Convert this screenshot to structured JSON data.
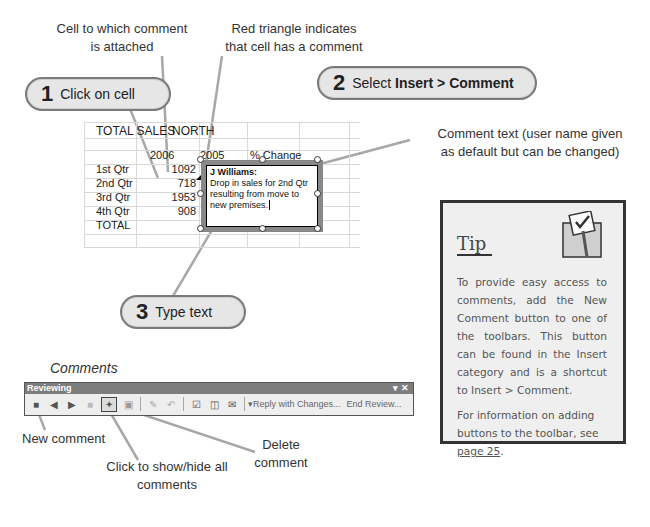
{
  "callouts": {
    "cell_attached": [
      "Cell to which comment",
      "is attached"
    ],
    "red_triangle": [
      "Red triangle indicates",
      "that cell has a comment"
    ],
    "comment_text": [
      "Comment text (user name given",
      "as default but can be changed)"
    ],
    "new_comment": "New comment",
    "show_hide": [
      "Click to show/hide all",
      "comments"
    ],
    "delete_comment": [
      "Delete",
      "comment"
    ]
  },
  "steps": [
    {
      "num": "1",
      "label": "Click on cell"
    },
    {
      "num": "2",
      "label_prefix": "Select ",
      "label_bold": "Insert > Comment"
    },
    {
      "num": "3",
      "label": "Type text"
    }
  ],
  "sheet": {
    "title": "TOTAL SALES",
    "region": "NORTH",
    "headers": [
      "2006",
      "2005",
      "% Change"
    ],
    "rows": [
      {
        "label": "1st Qtr",
        "value": "1092"
      },
      {
        "label": "2nd Qtr",
        "value": "718"
      },
      {
        "label": "3rd Qtr",
        "value": "1953"
      },
      {
        "label": "4th Qtr",
        "value": "908"
      },
      {
        "label": "TOTAL",
        "value": ""
      }
    ],
    "comment": {
      "author": "J Williams:",
      "lines": [
        "Drop in sales for 2nd Qtr",
        "resulting from move to",
        "new premises."
      ]
    }
  },
  "toolbar_section": {
    "caption": "Comments",
    "title": "Reviewing",
    "controls": "▾ ✕",
    "reply_label": "Reply with Changes...",
    "end_review_label": "End Review..."
  },
  "tip": {
    "title": "Tip",
    "para1": "To provide easy access to comments, add the New Comment button to one of the toolbars. This button can be found in the Insert category and is a shortcut to Insert > Comment.",
    "para2_prefix": "For information on adding buttons to the toolbar, see ",
    "para2_link": "page 25",
    "para2_suffix": "."
  },
  "colors": {
    "pill_bg": "#e6e6e6",
    "pill_border": "#7a7a7a",
    "tip_bg": "#efefef",
    "leader_line": "#a8a8a8"
  }
}
